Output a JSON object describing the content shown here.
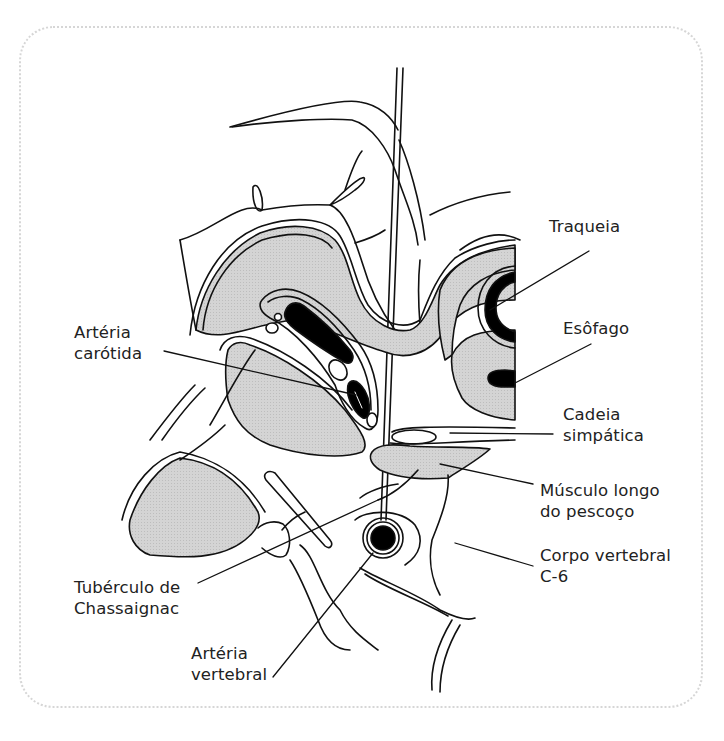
{
  "figure": {
    "colors": {
      "frame_border": "#d6d6d6",
      "line": "#111111",
      "fill_gray": "#cfcfcf",
      "fill_black": "#000000",
      "text": "#222222"
    }
  },
  "labels": [
    {
      "id": "traqueia",
      "lines": [
        "Traqueia"
      ]
    },
    {
      "id": "esofago",
      "lines": [
        "Esôfago"
      ]
    },
    {
      "id": "arteria-carotida",
      "lines": [
        "Artéria",
        "carótida"
      ]
    },
    {
      "id": "cadeia-simpatica",
      "lines": [
        "Cadeia",
        "simpática"
      ]
    },
    {
      "id": "musculo-longo-do-pescoco",
      "lines": [
        "Músculo longo",
        "do pescoço"
      ]
    },
    {
      "id": "corpo-vertebral-c6",
      "lines": [
        "Corpo vertebral",
        "C-6"
      ]
    },
    {
      "id": "tuberculo-de-chassaignac",
      "lines": [
        "Tubérculo de",
        "Chassaignac"
      ]
    },
    {
      "id": "arteria-vertebral",
      "lines": [
        "Artéria",
        "vertebral"
      ]
    }
  ]
}
